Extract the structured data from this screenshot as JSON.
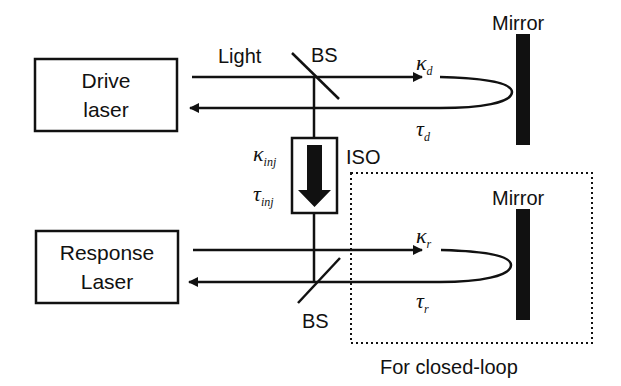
{
  "diagram": {
    "type": "optical-setup",
    "components": {
      "drive_laser": {
        "label_line1": "Drive",
        "label_line2": "laser"
      },
      "response_laser": {
        "label_line1": "Response",
        "label_line2": "Laser"
      },
      "beam_splitter_top": {
        "label": "BS"
      },
      "beam_splitter_bottom": {
        "label": "BS"
      },
      "isolator": {
        "label": "ISO"
      },
      "mirror_top": {
        "label": "Mirror"
      },
      "mirror_bottom": {
        "label": "Mirror"
      },
      "closed_loop_region": {
        "label": "For closed-loop"
      }
    },
    "labels": {
      "light": "Light",
      "kappa_d": {
        "symbol": "κ",
        "subscript": "d"
      },
      "tau_d": {
        "symbol": "τ",
        "subscript": "d"
      },
      "kappa_inj": {
        "symbol": "κ",
        "subscript": "inj"
      },
      "tau_inj": {
        "symbol": "τ",
        "subscript": "inj"
      },
      "kappa_r": {
        "symbol": "κ",
        "subscript": "r"
      },
      "tau_r": {
        "symbol": "τ",
        "subscript": "r"
      }
    },
    "colors": {
      "line": "#111111",
      "background": "#ffffff"
    }
  }
}
